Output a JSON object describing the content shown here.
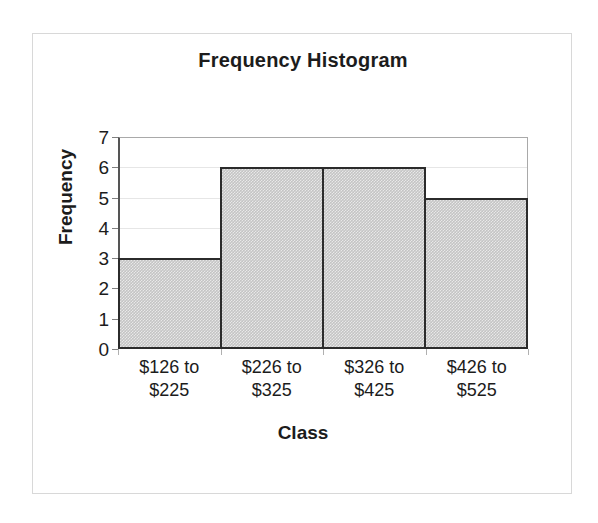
{
  "chart_data": {
    "type": "bar",
    "title": "Frequency Histogram",
    "xlabel": "Class",
    "ylabel": "Frequency",
    "categories": [
      "$126 to $225",
      "$226 to $325",
      "$326 to $425",
      "$426 to $525"
    ],
    "category_lines": [
      [
        "$126 to",
        "$225"
      ],
      [
        "$226 to",
        "$325"
      ],
      [
        "$326 to",
        "$425"
      ],
      [
        "$426 to",
        "$525"
      ]
    ],
    "values": [
      3,
      6,
      6,
      5
    ],
    "ylim": [
      0,
      7
    ],
    "ytick_labels": [
      "0",
      "1",
      "2",
      "3",
      "4",
      "5",
      "6",
      "7"
    ],
    "ytick_values": [
      0,
      1,
      2,
      3,
      4,
      5,
      6,
      7
    ],
    "grid": true,
    "legend": false,
    "bar_fill_color": "#c4c4c4",
    "bar_border_color": "#2b2b2b",
    "gridline_color": "#e6e6e6",
    "frame_color": "#d8d8d8",
    "text_color": "#1c1c1c"
  }
}
